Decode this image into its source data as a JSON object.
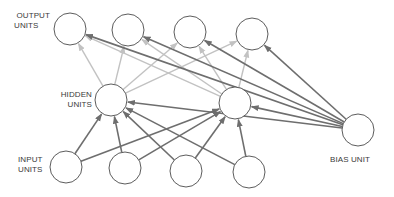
{
  "diagram": {
    "type": "neural-network",
    "labels": {
      "output": [
        "OUTPUT",
        "UNITS"
      ],
      "hidden": [
        "HIDDEN",
        "UNITS"
      ],
      "input": [
        "INPUT",
        "UNITS"
      ],
      "bias": "BIAS UNIT"
    },
    "colors": {
      "node_stroke": "#4a4a4a",
      "strong_edge": "#6e6e6e",
      "light_edge": "#c2c2c2",
      "text": "#3a3a3a"
    },
    "nodes": {
      "output": [
        {
          "id": "o1",
          "x": 70,
          "y": 29
        },
        {
          "id": "o2",
          "x": 128,
          "y": 30
        },
        {
          "id": "o3",
          "x": 190,
          "y": 32
        },
        {
          "id": "o4",
          "x": 252,
          "y": 34
        }
      ],
      "hidden": [
        {
          "id": "h1",
          "x": 111,
          "y": 100
        },
        {
          "id": "h2",
          "x": 235,
          "y": 103
        }
      ],
      "input": [
        {
          "id": "i1",
          "x": 66,
          "y": 167
        },
        {
          "id": "i2",
          "x": 125,
          "y": 168
        },
        {
          "id": "i3",
          "x": 186,
          "y": 171
        },
        {
          "id": "i4",
          "x": 249,
          "y": 172
        }
      ],
      "bias": {
        "id": "b",
        "x": 358,
        "y": 130
      }
    },
    "edges": {
      "input_to_hidden": [
        [
          "i1",
          "h1"
        ],
        [
          "i1",
          "h2"
        ],
        [
          "i2",
          "h1"
        ],
        [
          "i2",
          "h2"
        ],
        [
          "i3",
          "h1"
        ],
        [
          "i3",
          "h2"
        ],
        [
          "i4",
          "h1"
        ],
        [
          "i4",
          "h2"
        ]
      ],
      "hidden_to_output": [
        [
          "h1",
          "o1"
        ],
        [
          "h1",
          "o2"
        ],
        [
          "h1",
          "o3"
        ],
        [
          "h1",
          "o4"
        ],
        [
          "h2",
          "o1"
        ],
        [
          "h2",
          "o2"
        ],
        [
          "h2",
          "o3"
        ],
        [
          "h2",
          "o4"
        ]
      ],
      "bias_to_all": [
        [
          "b",
          "o1"
        ],
        [
          "b",
          "o2"
        ],
        [
          "b",
          "o3"
        ],
        [
          "b",
          "o4"
        ],
        [
          "b",
          "h1"
        ],
        [
          "b",
          "h2"
        ]
      ]
    }
  }
}
